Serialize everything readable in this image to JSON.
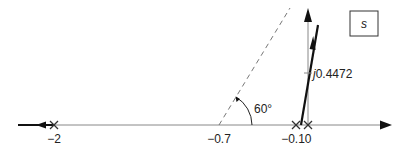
{
  "diagram": {
    "plane_label": "s",
    "real_axis_labels": {
      "neg2": "−2",
      "neg07": "−0.7",
      "neg01": "−0.1",
      "zero": "0"
    },
    "angle_label": "60°",
    "imag_crossing": {
      "prefix": "j",
      "value": "0.4472"
    },
    "poles": [
      {
        "s": -2,
        "symbol": "X"
      },
      {
        "s": -0.1,
        "symbol": "X"
      },
      {
        "s": 0,
        "symbol": "X"
      }
    ],
    "colors": {
      "axis": "#888888",
      "locus": "#111111",
      "dashed": "#777777",
      "text": "#222222"
    }
  }
}
